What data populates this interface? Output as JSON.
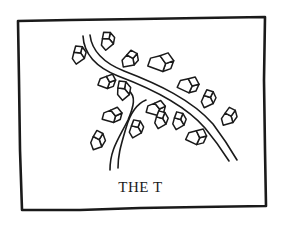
{
  "diagram": {
    "caption": "THE T",
    "colors": {
      "ink": "#1a1a1a",
      "paper": "#ffffff"
    },
    "frame": {
      "points": [
        [
          18,
          21
        ],
        [
          70,
          20
        ],
        [
          140,
          19
        ],
        [
          200,
          18
        ],
        [
          265,
          17
        ],
        [
          264,
          80
        ],
        [
          265,
          150
        ],
        [
          266,
          206
        ],
        [
          200,
          207
        ],
        [
          140,
          208
        ],
        [
          80,
          210
        ],
        [
          22,
          210
        ],
        [
          20,
          150
        ],
        [
          19,
          80
        ]
      ]
    },
    "roads": [
      {
        "name": "main-road",
        "edges": [
          "M83,36 C84,55 98,68 118,76 C150,88 185,105 205,128 C215,140 222,150 229,161",
          "M90,35 C92,52 104,63 124,71 C158,84 192,100 213,124 C222,136 230,148 237,160"
        ]
      },
      {
        "name": "branch-road",
        "edges": [
          "M129,91 C136,96 134,106 128,120 C118,140 110,150 110,170",
          "M146,100 C136,104 130,114 126,128 C120,148 118,156 118,168"
        ]
      }
    ],
    "houses": [
      {
        "x": 78,
        "y": 58,
        "w": 10,
        "d": 9,
        "h": 8,
        "rot": -35
      },
      {
        "x": 107,
        "y": 44,
        "w": 10,
        "d": 9,
        "h": 8,
        "rot": -40
      },
      {
        "x": 128,
        "y": 62,
        "w": 11,
        "d": 9,
        "h": 8,
        "rot": -10
      },
      {
        "x": 157,
        "y": 64,
        "w": 16,
        "d": 12,
        "h": 10,
        "rot": 20
      },
      {
        "x": 185,
        "y": 86,
        "w": 13,
        "d": 10,
        "h": 9,
        "rot": 25
      },
      {
        "x": 207,
        "y": 102,
        "w": 10,
        "d": 9,
        "h": 8,
        "rot": -25
      },
      {
        "x": 227,
        "y": 120,
        "w": 10,
        "d": 10,
        "h": 8,
        "rot": -15
      },
      {
        "x": 104,
        "y": 83,
        "w": 10,
        "d": 9,
        "h": 8,
        "rot": 20
      },
      {
        "x": 123,
        "y": 94,
        "w": 9,
        "d": 10,
        "h": 9,
        "rot": -40
      },
      {
        "x": 109,
        "y": 117,
        "w": 12,
        "d": 10,
        "h": 8,
        "rot": 15
      },
      {
        "x": 96,
        "y": 144,
        "w": 9,
        "d": 10,
        "h": 9,
        "rot": -20
      },
      {
        "x": 135,
        "y": 132,
        "w": 10,
        "d": 9,
        "h": 8,
        "rot": -30
      },
      {
        "x": 153,
        "y": 110,
        "w": 12,
        "d": 9,
        "h": 8,
        "rot": 15
      },
      {
        "x": 160,
        "y": 123,
        "w": 9,
        "d": 9,
        "h": 8,
        "rot": -30
      },
      {
        "x": 178,
        "y": 124,
        "w": 9,
        "d": 9,
        "h": 8,
        "rot": -30
      },
      {
        "x": 193,
        "y": 138,
        "w": 12,
        "d": 10,
        "h": 9,
        "rot": 25
      }
    ]
  }
}
